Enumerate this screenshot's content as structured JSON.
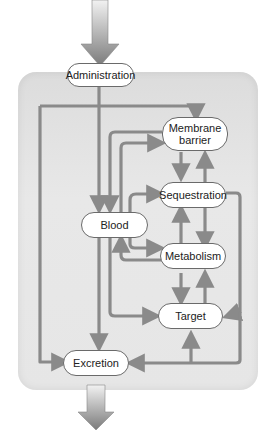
{
  "diagram": {
    "type": "flowchart",
    "nodes": {
      "administration": "Administration",
      "membrane_barrier": "Membrane barrier",
      "membrane_line1": "Membrane",
      "membrane_line2": "barrier",
      "sequestration": "Sequestration",
      "blood": "Blood",
      "metabolism": "Metabolism",
      "target": "Target",
      "excretion": "Excretion"
    },
    "edges": [
      {
        "from": "input",
        "to": "Administration",
        "style": "large-gradient-arrow"
      },
      {
        "from": "Administration",
        "to": "Blood"
      },
      {
        "from": "Blood",
        "to": "Membrane barrier"
      },
      {
        "from": "Membrane barrier",
        "to": "Blood"
      },
      {
        "from": "Membrane barrier",
        "to": "Sequestration"
      },
      {
        "from": "Sequestration",
        "to": "Membrane barrier"
      },
      {
        "from": "Blood",
        "to": "Sequestration"
      },
      {
        "from": "Blood",
        "to": "Metabolism"
      },
      {
        "from": "Metabolism",
        "to": "Blood"
      },
      {
        "from": "Sequestration",
        "to": "Metabolism"
      },
      {
        "from": "Metabolism",
        "to": "Sequestration"
      },
      {
        "from": "Metabolism",
        "to": "Target"
      },
      {
        "from": "Target",
        "to": "Metabolism"
      },
      {
        "from": "Blood",
        "to": "Target"
      },
      {
        "from": "Sequestration",
        "to": "Target"
      },
      {
        "from": "Sequestration",
        "to": "Excretion"
      },
      {
        "from": "Excretion",
        "to": "Target"
      },
      {
        "from": "Membrane barrier",
        "to": "Excretion"
      },
      {
        "from": "Blood",
        "to": "Excretion"
      },
      {
        "from": "Excretion",
        "to": "output",
        "style": "large-gradient-arrow"
      }
    ],
    "colors": {
      "arrow": "#8a8a8a",
      "panel": "#e2e2e2",
      "node_fill": "#ffffff",
      "node_border": "#6a6a6a"
    }
  }
}
